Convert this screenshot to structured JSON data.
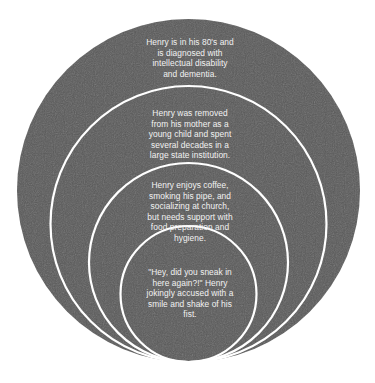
{
  "diagram": {
    "type": "nested-circles",
    "colors": {
      "fill": "#5a5a5a",
      "ring_stroke": "#ffffff",
      "text": "#f2f2f2",
      "background": "#ffffff"
    },
    "layers": [
      {
        "level": 1,
        "label": "outermost",
        "lines": [
          "Henry is in his 80's and",
          "is diagnosed with",
          "intellectual disability",
          "and dementia."
        ]
      },
      {
        "level": 2,
        "label": "second",
        "lines": [
          "Henry was removed",
          "from his mother as a",
          "young child and spent",
          "several decades in a",
          "large state institution."
        ]
      },
      {
        "level": 3,
        "label": "third",
        "lines": [
          "Henry enjoys coffee,",
          "smoking his pipe, and",
          "socializing at church,",
          "but needs support with",
          "food preparation and",
          "hygiene."
        ]
      },
      {
        "level": 4,
        "label": "innermost",
        "lines": [
          "\"Hey, did you sneak in",
          "here again?!\" Henry",
          "jokingly accused with a",
          "smile and shake of his",
          "fist."
        ]
      }
    ]
  }
}
